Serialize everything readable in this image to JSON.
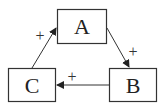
{
  "diagram": {
    "type": "causal-loop",
    "nodes": [
      {
        "id": "A",
        "label": "A"
      },
      {
        "id": "B",
        "label": "B"
      },
      {
        "id": "C",
        "label": "C"
      }
    ],
    "edges": [
      {
        "from": "A",
        "to": "B",
        "label": "+"
      },
      {
        "from": "B",
        "to": "C",
        "label": "+"
      },
      {
        "from": "C",
        "to": "A",
        "label": "+"
      }
    ],
    "colors": {
      "stroke": "#333333",
      "background": "#ffffff"
    }
  }
}
